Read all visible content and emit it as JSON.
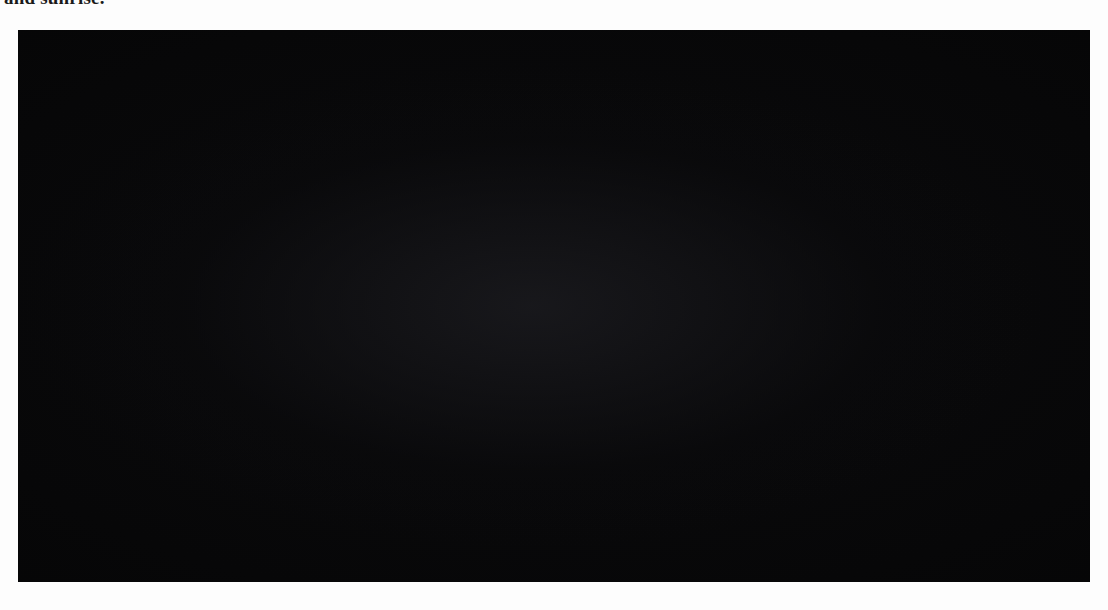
{
  "page": {
    "caption_fragment": "and sunrise.",
    "background_color": "#ffffff"
  },
  "figure": {
    "panel_background": "#050505",
    "orbit_color": "#d6d6d2",
    "rotation_arrow_color": "#ffffff",
    "marker_color": "#b9b9b4",
    "labels": {
      "mercury": "Mercury",
      "sun": "Sun",
      "start": "Start",
      "one_rotation": "One rotation completed"
    },
    "sun": {
      "label": "Sun",
      "cx": 672,
      "cy": 276,
      "r": 52,
      "color": "#d8d6cf"
    }
  },
  "chart_data": {
    "type": "diagram",
    "orbit": {
      "center_x": 535,
      "center_y": 276,
      "radius_x": 390,
      "radius_y": 238,
      "direction": "counterclockwise",
      "band_width": 15,
      "arrowhead_count": 12
    },
    "positions": [
      {
        "index": 1,
        "name": "Start",
        "angle_deg": 0,
        "sphere_r": 34,
        "marker": "both-flags",
        "rotation_arrow": "ccw"
      },
      {
        "index": 2,
        "name": "position-2",
        "angle_deg": 30,
        "sphere_r": 32,
        "marker": "flag-left",
        "rotation_arrow": "ccw"
      },
      {
        "index": 3,
        "name": "position-3",
        "angle_deg": 60,
        "sphere_r": 31,
        "marker": "flag-down",
        "rotation_arrow": "ccw"
      },
      {
        "index": 4,
        "name": "position-4",
        "angle_deg": 90,
        "sphere_r": 31,
        "marker": "flag-down",
        "rotation_arrow": "ccw"
      },
      {
        "index": 5,
        "name": "Mercury",
        "angle_deg": 120,
        "sphere_r": 31,
        "marker": "flag-right",
        "rotation_arrow": "ccw"
      },
      {
        "index": 6,
        "name": "position-6",
        "angle_deg": 150,
        "sphere_r": 31,
        "marker": "flag-right",
        "rotation_arrow": "ccw"
      },
      {
        "index": 7,
        "name": "position-7",
        "angle_deg": 180,
        "sphere_r": 33,
        "marker": "flag-up",
        "rotation_arrow": "ccw"
      },
      {
        "index": 8,
        "name": "One rotation completed",
        "angle_deg": 210,
        "sphere_r": 32,
        "marker": "flag-up",
        "rotation_arrow": "ccw"
      },
      {
        "index": 9,
        "name": "position-9",
        "angle_deg": 240,
        "sphere_r": 31,
        "marker": "flag-left",
        "rotation_arrow": "ccw"
      },
      {
        "index": 10,
        "name": "position-10",
        "angle_deg": 270,
        "sphere_r": 31,
        "marker": "flag-left",
        "rotation_arrow": "ccw"
      },
      {
        "index": 11,
        "name": "position-11",
        "angle_deg": 300,
        "sphere_r": 31,
        "marker": "flag-down",
        "rotation_arrow": "ccw"
      },
      {
        "index": 12,
        "name": "position-12",
        "angle_deg": 330,
        "sphere_r": 32,
        "marker": "flag-down",
        "rotation_arrow": "ccw"
      }
    ],
    "annotations": [
      {
        "text": "Start",
        "x": 838,
        "y": 292
      },
      {
        "text": "Mercury",
        "x": 345,
        "y": 165
      },
      {
        "text": "Sun",
        "x": 652,
        "y": 360
      },
      {
        "text": "One rotation completed",
        "x": 37,
        "y": 470
      }
    ]
  }
}
